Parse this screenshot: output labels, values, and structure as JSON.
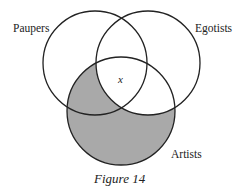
{
  "diagram": {
    "type": "venn",
    "sets": [
      {
        "name": "Paupers",
        "cx": 95,
        "cy": 63,
        "r": 52
      },
      {
        "name": "Egotists",
        "cx": 148,
        "cy": 63,
        "r": 52
      },
      {
        "name": "Artists",
        "cx": 121,
        "cy": 111,
        "r": 54
      }
    ],
    "shaded_regions": [
      "Artists only",
      "Artists and Paupers but not Egotists"
    ],
    "shade_color": "#a9a9a9",
    "stroke_color": "#222222",
    "marker": {
      "text": "x",
      "region": "Paupers, Egotists and Artists"
    },
    "caption": "Figure 14"
  },
  "labels": {
    "paupers": "Paupers",
    "egotists": "Egotists",
    "artists": "Artists",
    "x": "x",
    "caption": "Figure 14"
  }
}
